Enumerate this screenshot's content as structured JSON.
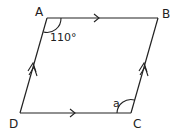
{
  "figure": {
    "type": "parallelogram",
    "vertices": {
      "A": {
        "label": "A",
        "x": 47,
        "y": 18
      },
      "B": {
        "label": "B",
        "x": 158,
        "y": 18
      },
      "C": {
        "label": "C",
        "x": 131,
        "y": 113
      },
      "D": {
        "label": "D",
        "x": 20,
        "y": 113
      }
    },
    "angle_A": {
      "label": "110°"
    },
    "angle_C": {
      "label": "a"
    },
    "parallel_marks": {
      "AB_DC": "single arrow",
      "AD_BC": "double arrow"
    },
    "stroke_color": "#222222"
  }
}
